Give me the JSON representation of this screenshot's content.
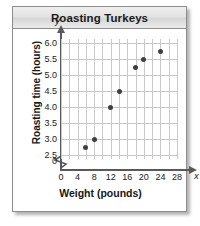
{
  "panel": {
    "title": "Roasting Turkeys"
  },
  "chart_data": {
    "type": "scatter",
    "title": "Roasting Turkeys",
    "xlabel": "Weight (pounds)",
    "ylabel": "Roasting time (hours)",
    "x_axis_variable": "x",
    "y_axis_variable": "y",
    "xlim": [
      0,
      28
    ],
    "ylim": [
      2.375,
      6.125
    ],
    "y_axis_break": true,
    "y_axis_break_symbol": "zigzag",
    "grid": true,
    "grid_x_step": 2,
    "grid_y_step": 0.25,
    "legend": "none",
    "origin_label": "0",
    "xticks": [
      0,
      4,
      8,
      12,
      16,
      20,
      24,
      28
    ],
    "xtick_labels": [
      "0",
      "4",
      "8",
      "12",
      "16",
      "20",
      "24",
      "28"
    ],
    "yticks": [
      2.5,
      3.0,
      3.5,
      4.0,
      4.5,
      5.0,
      5.5,
      6.0
    ],
    "ytick_labels": [
      "2.5",
      "3.0",
      "3.5",
      "4.0",
      "4.5",
      "5.0",
      "5.5",
      "6.0"
    ],
    "points": [
      {
        "x": 6,
        "y": 2.75
      },
      {
        "x": 8,
        "y": 3.0
      },
      {
        "x": 12,
        "y": 4.0
      },
      {
        "x": 14,
        "y": 4.5
      },
      {
        "x": 18,
        "y": 5.25
      },
      {
        "x": 20,
        "y": 5.5
      },
      {
        "x": 24,
        "y": 5.75
      }
    ],
    "marker_color": "#3f3f3f",
    "grid_color": "#c9c9c9",
    "axis_color": "#595959"
  }
}
